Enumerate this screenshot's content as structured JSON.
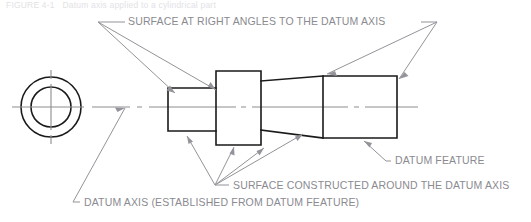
{
  "figure": {
    "caption_partial": "FIGURE 4-1   Datum axis applied to a cylindrical part",
    "annotations": {
      "top_note": "SURFACE AT RIGHT ANGLES TO THE DATUM AXIS",
      "datum_feature": "DATUM FEATURE",
      "surface_constructed": "SURFACE CONSTRUCTED AROUND THE DATUM AXIS",
      "datum_axis": "DATUM AXIS (ESTABLISHED FROM DATUM FEATURE)"
    },
    "colors": {
      "object_line": "#1a1a1a",
      "center_line": "#8d8d92",
      "leader_line": "#93939a",
      "note_text": "#8a8a90",
      "background": "#ffffff"
    },
    "views": {
      "end_view": {
        "name": "end-view-concentric-circles",
        "center_x": 51,
        "center_y": 107,
        "outer_radius": 30,
        "inner_radius": 20
      },
      "side_view": {
        "name": "side-view-stepped-shaft",
        "segments": [
          {
            "label": "small-cylinder",
            "x1": 168,
            "x2": 216,
            "top": 88,
            "bottom": 131
          },
          {
            "label": "center-block",
            "x1": 216,
            "x2": 261,
            "top": 71,
            "bottom": 145
          },
          {
            "label": "taper",
            "x1": 261,
            "x2": 323,
            "top_left": 81,
            "bottom_left": 130,
            "top_right": 76,
            "bottom_right": 138
          },
          {
            "label": "large-cylinder",
            "x1": 323,
            "x2": 397,
            "top": 76,
            "bottom": 138
          }
        ]
      }
    }
  }
}
